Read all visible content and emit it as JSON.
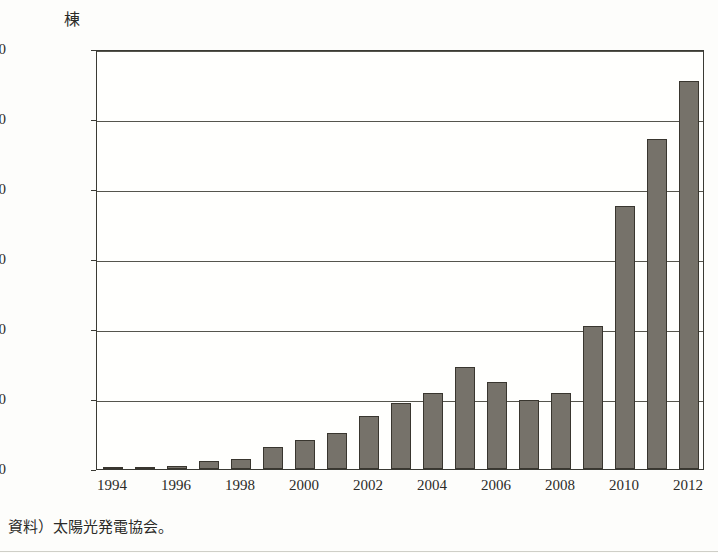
{
  "figure": {
    "unit_label": "棟",
    "source_note": "資料）太陽光発電協会。",
    "bar_color": "#76726a",
    "bar_border_color": "#39362f",
    "frame_color": "#3a3a34",
    "grid_color": "#55554d"
  },
  "chart_data": {
    "type": "bar",
    "title": "",
    "subtitle": "",
    "xlabel": "",
    "ylabel": "棟",
    "ylim": [
      0,
      300000
    ],
    "ytick_values": [
      0,
      50000,
      100000,
      150000,
      200000,
      250000,
      300000
    ],
    "ytick_labels": [
      "0",
      "50,000",
      "100,000",
      "150,000",
      "200,000",
      "250,000",
      "300,000"
    ],
    "grid": true,
    "legend": "none",
    "categories": [
      "1994",
      "1995",
      "1996",
      "1997",
      "1998",
      "1999",
      "2000",
      "2001",
      "2002",
      "2003",
      "2004",
      "2005",
      "2006",
      "2007",
      "2008",
      "2009",
      "2010",
      "2011",
      "2012"
    ],
    "xtick_labels_shown": [
      "1994",
      "1996",
      "1998",
      "2000",
      "2002",
      "2004",
      "2006",
      "2008",
      "2010",
      "2012"
    ],
    "values": [
      1000,
      1200,
      2500,
      6000,
      6800,
      16000,
      21000,
      26000,
      38000,
      47000,
      54000,
      73000,
      62000,
      49000,
      54000,
      102000,
      188000,
      236000,
      277000
    ],
    "series": [
      {
        "name": "住宅用太陽光発電導入件数",
        "values": [
          1000,
          1200,
          2500,
          6000,
          6800,
          16000,
          21000,
          26000,
          38000,
          47000,
          54000,
          73000,
          62000,
          49000,
          54000,
          102000,
          188000,
          236000,
          277000
        ]
      }
    ]
  }
}
